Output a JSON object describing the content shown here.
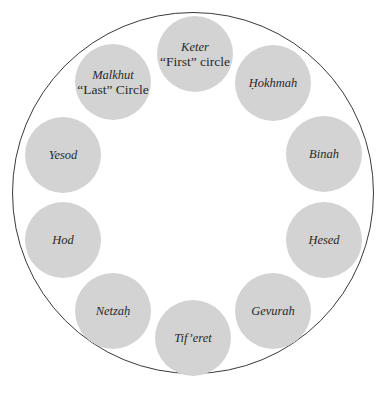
{
  "diagram": {
    "type": "circle of sefirot",
    "outer_circle": {
      "cx": 193,
      "cy": 193,
      "r": 181,
      "stroke": "#3a3a3a"
    },
    "node_fill": "#d3d3d3",
    "node_radius": 38,
    "nodes": [
      {
        "id": "keter",
        "name": "Keter",
        "sub": "“First” circle",
        "cx": 195,
        "cy": 54
      },
      {
        "id": "hokhmah",
        "name": "Ḥokhmah",
        "sub": "",
        "cx": 273,
        "cy": 83
      },
      {
        "id": "binah",
        "name": "Binah",
        "sub": "",
        "cx": 324,
        "cy": 154
      },
      {
        "id": "hesed",
        "name": "Ḥesed",
        "sub": "",
        "cx": 324,
        "cy": 240
      },
      {
        "id": "gevurah",
        "name": "Gevurah",
        "sub": "",
        "cx": 273,
        "cy": 311
      },
      {
        "id": "tiferet",
        "name": "Tif’eret",
        "sub": "",
        "cx": 193,
        "cy": 338
      },
      {
        "id": "netzah",
        "name": "Netzaḥ",
        "sub": "",
        "cx": 113,
        "cy": 311
      },
      {
        "id": "hod",
        "name": "Hod",
        "sub": "",
        "cx": 63,
        "cy": 240
      },
      {
        "id": "yesod",
        "name": "Yesod",
        "sub": "",
        "cx": 63,
        "cy": 155
      },
      {
        "id": "malkhut",
        "name": "Malkhut",
        "sub": "“Last” Circle",
        "cx": 113,
        "cy": 82
      }
    ]
  }
}
